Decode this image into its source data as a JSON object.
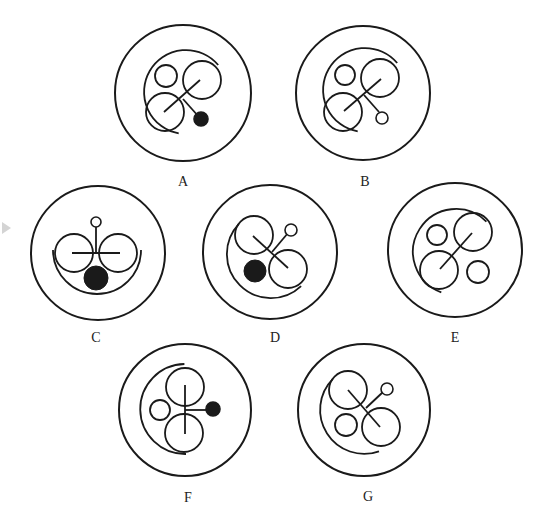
{
  "figure": {
    "type": "visual-reasoning-puzzle",
    "stroke_color": "#1a1a1a",
    "fill_color": "#1a1a1a",
    "background": "#ffffff",
    "options": [
      {
        "label": "A",
        "center": [
          183,
          93
        ],
        "outer_r": 68,
        "label_pos": [
          183,
          182
        ],
        "inner_arc": {
          "cx": 186,
          "cy": 92,
          "r": 42,
          "start_deg": -40,
          "end_deg": 100,
          "sweep": "ccw"
        },
        "circles": [
          {
            "cx": 166,
            "cy": 76,
            "r": 11
          },
          {
            "cx": 202,
            "cy": 80,
            "r": 19
          },
          {
            "cx": 165,
            "cy": 112,
            "r": 19
          }
        ],
        "lines": [
          [
            164,
            112,
            200,
            80
          ],
          [
            183,
            99,
            199,
            117
          ]
        ],
        "end_dot": {
          "cx": 201,
          "cy": 119,
          "r": 7,
          "filled": true
        }
      },
      {
        "label": "B",
        "center": [
          363,
          93
        ],
        "outer_r": 67,
        "label_pos": [
          365,
          182
        ],
        "inner_arc": {
          "cx": 365,
          "cy": 90,
          "r": 42,
          "start_deg": -40,
          "end_deg": 100,
          "sweep": "ccw"
        },
        "circles": [
          {
            "cx": 345,
            "cy": 75,
            "r": 10
          },
          {
            "cx": 380,
            "cy": 78,
            "r": 19
          },
          {
            "cx": 343,
            "cy": 112,
            "r": 19
          }
        ],
        "lines": [
          [
            344,
            111,
            381,
            79
          ],
          [
            364,
            95,
            379,
            112
          ]
        ],
        "end_dot": {
          "cx": 382,
          "cy": 118,
          "r": 6,
          "filled": false
        }
      },
      {
        "label": "C",
        "center": [
          98,
          253
        ],
        "outer_r": 67,
        "label_pos": [
          96,
          338
        ],
        "inner_arc": {
          "cx": 97,
          "cy": 250,
          "r": 44,
          "start_deg": 180,
          "end_deg": 0,
          "sweep": "ccw"
        },
        "circles": [
          {
            "cx": 74,
            "cy": 253,
            "r": 19
          },
          {
            "cx": 118,
            "cy": 253,
            "r": 19
          }
        ],
        "lines": [
          [
            72,
            253,
            120,
            253
          ],
          [
            96,
            227,
            96,
            253
          ]
        ],
        "end_dot": {
          "cx": 96,
          "cy": 222,
          "r": 5,
          "filled": false
        },
        "filled_circle": {
          "cx": 96,
          "cy": 278,
          "r": 12
        }
      },
      {
        "label": "D",
        "center": [
          270,
          252
        ],
        "outer_r": 67,
        "label_pos": [
          275,
          338
        ],
        "inner_arc": {
          "cx": 270,
          "cy": 255,
          "r": 44,
          "start_deg": -135,
          "end_deg": 45,
          "sweep": "ccw"
        },
        "circles": [
          {
            "cx": 254,
            "cy": 235,
            "r": 19
          },
          {
            "cx": 288,
            "cy": 269,
            "r": 19
          }
        ],
        "lines": [
          [
            253,
            236,
            288,
            268
          ],
          [
            272,
            252,
            288,
            233
          ]
        ],
        "end_dot": {
          "cx": 291,
          "cy": 230,
          "r": 6,
          "filled": false
        },
        "filled_circle": {
          "cx": 255,
          "cy": 271,
          "r": 11
        }
      },
      {
        "label": "E",
        "center": [
          455,
          250
        ],
        "outer_r": 67,
        "label_pos": [
          455,
          338
        ],
        "inner_arc": {
          "cx": 456,
          "cy": 252,
          "r": 43,
          "start_deg": -45,
          "end_deg": 110,
          "sweep": "ccw"
        },
        "circles": [
          {
            "cx": 437,
            "cy": 235,
            "r": 10
          },
          {
            "cx": 473,
            "cy": 232,
            "r": 19
          },
          {
            "cx": 439,
            "cy": 270,
            "r": 19
          },
          {
            "cx": 478,
            "cy": 272,
            "r": 11
          }
        ],
        "lines": [
          [
            440,
            269,
            472,
            233
          ]
        ]
      },
      {
        "label": "F",
        "center": [
          185,
          410
        ],
        "outer_r": 66,
        "label_pos": [
          188,
          498
        ],
        "inner_arc": {
          "cx": 186,
          "cy": 409,
          "r": 45,
          "start_deg": -92,
          "end_deg": 90,
          "sweep": "ccw"
        },
        "circles": [
          {
            "cx": 185,
            "cy": 387,
            "r": 19
          },
          {
            "cx": 184,
            "cy": 433,
            "r": 19
          },
          {
            "cx": 160,
            "cy": 410,
            "r": 10
          }
        ],
        "lines": [
          [
            185,
            385,
            185,
            434
          ],
          [
            185,
            410,
            207,
            410
          ]
        ],
        "end_dot": {
          "cx": 213,
          "cy": 409,
          "r": 7,
          "filled": true
        }
      },
      {
        "label": "G",
        "center": [
          364,
          410
        ],
        "outer_r": 66,
        "label_pos": [
          368,
          497
        ],
        "inner_arc": {
          "cx": 364,
          "cy": 410,
          "r": 44,
          "start_deg": -135,
          "end_deg": 70,
          "sweep": "ccw"
        },
        "circles": [
          {
            "cx": 348,
            "cy": 390,
            "r": 19
          },
          {
            "cx": 346,
            "cy": 425,
            "r": 11
          },
          {
            "cx": 381,
            "cy": 427,
            "r": 19
          }
        ],
        "lines": [
          [
            348,
            390,
            380,
            427
          ],
          [
            366,
            408,
            383,
            392
          ]
        ],
        "end_dot": {
          "cx": 387,
          "cy": 389,
          "r": 6,
          "filled": false
        }
      }
    ]
  }
}
